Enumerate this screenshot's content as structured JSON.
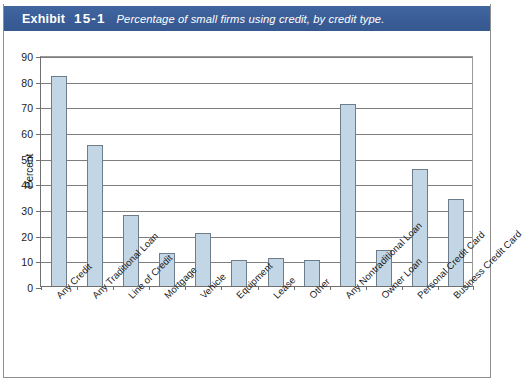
{
  "header": {
    "exhibit_label": "Exhibit",
    "exhibit_number": "15-1",
    "caption": "Percentage of small firms using credit, by credit type.",
    "band_color": "#3c619b",
    "text_color": "#ffffff"
  },
  "chart_data": {
    "type": "bar",
    "title": "Percentage of small firms using credit, by credit type.",
    "xlabel": "",
    "ylabel": "Percent",
    "ylim": [
      0,
      90
    ],
    "yticks": [
      0,
      10,
      20,
      30,
      40,
      50,
      60,
      70,
      80,
      90
    ],
    "ytick_labels": [
      "0",
      "10",
      "20",
      "30",
      "40",
      "50",
      "60",
      "70",
      "80",
      "90"
    ],
    "grid": true,
    "legend": null,
    "bar_fill_color": "#c3d6e6",
    "bar_edge_color": "#6d7d8c",
    "categories": [
      "Any Credit",
      "Any Traditional Loan",
      "Line of Credit",
      "Mortgage",
      "Vehicle",
      "Equipment",
      "Lease",
      "Other",
      "Any Nontraditional Loan",
      "Owner Loan",
      "Personal Credit Card",
      "Business Credit Card"
    ],
    "values": [
      82,
      55,
      27.5,
      13,
      20.5,
      10,
      11,
      10,
      71,
      14,
      45.5,
      34
    ]
  }
}
